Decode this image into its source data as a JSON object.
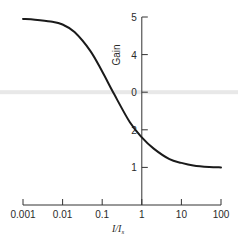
{
  "chart_data": {
    "type": "line",
    "title": "",
    "xlabel": "I/I",
    "xlabel_subscript": "s",
    "ylabel": "Gain",
    "x_scale": "log",
    "xlim": [
      0.001,
      100
    ],
    "ylim": [
      0,
      5
    ],
    "x_ticks": [
      0.001,
      0.01,
      0.1,
      1,
      10,
      100
    ],
    "x_tick_labels": [
      "0.001",
      "0.01",
      "0.1",
      "1",
      "10",
      "100"
    ],
    "y_ticks": [
      5,
      4,
      3,
      2,
      1
    ],
    "y_tick_labels": [
      "5",
      "4",
      "0",
      "2",
      "1"
    ],
    "grid": false,
    "legend": "none",
    "series": [
      {
        "name": "Gain",
        "x": [
          0.001,
          0.002,
          0.005,
          0.01,
          0.02,
          0.05,
          0.1,
          0.2,
          0.5,
          1,
          2,
          5,
          10,
          20,
          50,
          100
        ],
        "y": [
          4.95,
          4.93,
          4.88,
          4.8,
          4.6,
          4.1,
          3.55,
          2.95,
          2.2,
          1.8,
          1.5,
          1.22,
          1.12,
          1.05,
          1.01,
          1.0
        ]
      }
    ],
    "annotations": [
      {
        "type": "horizontal-band",
        "y": 3,
        "color": "#e6e6e6"
      }
    ]
  },
  "colors": {
    "line": "#1a1a1a",
    "axis": "#333333",
    "band": "#e8e8e8"
  }
}
